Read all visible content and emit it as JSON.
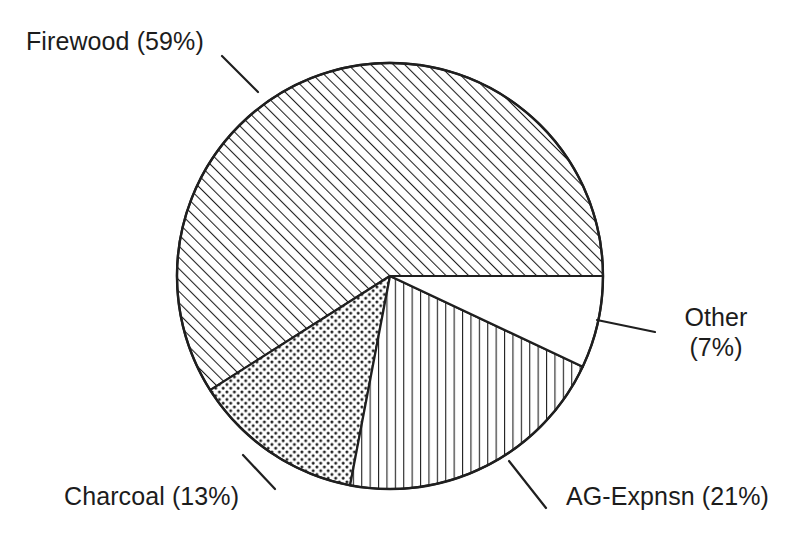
{
  "chart_data": {
    "type": "pie",
    "title": "",
    "subtitle": "",
    "xlabel": "",
    "ylabel": "",
    "legend_position": "none",
    "grid": false,
    "units": "percent",
    "start_angle_deg": 0,
    "direction": "counterclockwise",
    "categories": [
      "Firewood",
      "Charcoal",
      "AG-Expnsn",
      "Other"
    ],
    "values": [
      59,
      13,
      21,
      7
    ],
    "labels": [
      "Firewood (59%)",
      "Charcoal (13%)",
      "AG-Expnsn (21%)",
      "Other (7%)"
    ],
    "slices": [
      {
        "name": "Firewood",
        "value": 59,
        "label": "Firewood (59%)",
        "pattern": "diagonal-hatch",
        "fill_color": "#ffffff",
        "line_color": "#1f1f1f",
        "start_deg": 0,
        "sweep_deg": 212.4
      },
      {
        "name": "Charcoal",
        "value": 13,
        "label": "Charcoal (13%)",
        "pattern": "dotted-stipple",
        "fill_color": "#ffffff",
        "line_color": "#1f1f1f",
        "start_deg": 212.4,
        "sweep_deg": 46.8
      },
      {
        "name": "AG-Expnsn",
        "value": 21,
        "label": "AG-Expnsn (21%)",
        "pattern": "vertical-hatch",
        "fill_color": "#ffffff",
        "line_color": "#1f1f1f",
        "start_deg": 259.2,
        "sweep_deg": 75.6
      },
      {
        "name": "Other",
        "value": 7,
        "label": "Other (7%)",
        "pattern": "blank",
        "fill_color": "#ffffff",
        "line_color": "#1f1f1f",
        "start_deg": 334.8,
        "sweep_deg": 25.2
      }
    ]
  },
  "labels": {
    "firewood": "Firewood (59%)",
    "charcoal": "Charcoal (13%)",
    "ag_expnsn": "AG-Expnsn (21%)",
    "other_name": "Other",
    "other_pct": "(7%)"
  },
  "colors": {
    "ink": "#1f1f1f",
    "background": "#ffffff"
  }
}
